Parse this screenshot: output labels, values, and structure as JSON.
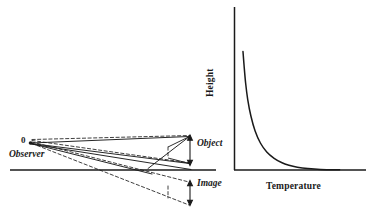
{
  "figure": {
    "type": "physics-optics-diagram-with-plot",
    "background_color": "#ffffff",
    "ink_color": "#1a1a1a"
  },
  "ray_diagram": {
    "origin_label": "0",
    "observer_label": "Observer",
    "object_label": "Object",
    "image_label": "Image",
    "ground_line": {
      "x_start": 10,
      "x_end": 216,
      "y": 170
    },
    "observer_point": {
      "x": 30,
      "y": 143
    },
    "solid_rays": [
      {
        "name": "ray-to-object-top",
        "x1": 30,
        "y1": 143,
        "x2": 190,
        "y2": 137
      },
      {
        "name": "ray-to-object-bottom",
        "x1": 30,
        "y1": 143,
        "x2": 190,
        "y2": 164
      },
      {
        "name": "ray-refracted-lower",
        "x1": 30,
        "y1": 143,
        "x2": 192,
        "y2": 170
      },
      {
        "name": "ray-refracted-crossing",
        "x1": 30,
        "y1": 144,
        "x2": 150,
        "y2": 173
      }
    ],
    "dashed_rays": [
      {
        "name": "dashed-upper-to-object",
        "x1": 32,
        "y1": 140,
        "x2": 190,
        "y2": 136
      },
      {
        "name": "dashed-bounce-to-object-bottom",
        "x1": 32,
        "y1": 141,
        "x2": 190,
        "y2": 163
      },
      {
        "name": "dashed-virtual-image-upper",
        "x1": 32,
        "y1": 142,
        "x2": 190,
        "y2": 182
      },
      {
        "name": "dashed-virtual-image-lower",
        "x1": 32,
        "y1": 144,
        "x2": 190,
        "y2": 204
      }
    ],
    "object_arrow": {
      "x": 190,
      "y_top": 136,
      "y_bottom": 164,
      "double_headed": true
    },
    "image_arrow": {
      "x": 190,
      "y_top": 181,
      "y_bottom": 205,
      "double_headed": true
    },
    "object_outline": {
      "points": "168,148 190,136 190,164 168,158"
    }
  },
  "chart_data": {
    "type": "line",
    "title": "",
    "xlabel": "Temperature",
    "ylabel": "Height",
    "grid": false,
    "legend": false,
    "axis": {
      "origin_x": 234,
      "origin_y": 170,
      "y_top": 7,
      "x_right": 366
    },
    "xlim": [
      0,
      1
    ],
    "ylim": [
      0,
      1
    ],
    "x_ticks": [],
    "y_ticks": [],
    "series": [
      {
        "name": "temperature-height-profile",
        "description": "Temperature decreases sharply with height near the ground, then asymptotes",
        "x": [
          0.085,
          0.095,
          0.11,
          0.13,
          0.16,
          0.2,
          0.25,
          0.31,
          0.38,
          0.45,
          0.52,
          0.6,
          0.7,
          0.82,
          1.0
        ],
        "y": [
          0.79,
          0.7,
          0.58,
          0.47,
          0.36,
          0.26,
          0.18,
          0.12,
          0.078,
          0.05,
          0.032,
          0.019,
          0.01,
          0.004,
          0.001
        ]
      }
    ]
  },
  "caption": {
    "text": ""
  }
}
